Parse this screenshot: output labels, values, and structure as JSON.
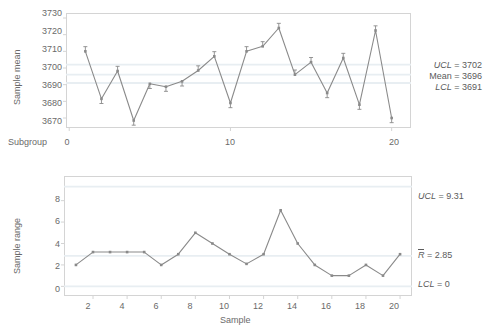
{
  "chart_data": [
    {
      "type": "line",
      "name": "xbar-chart",
      "title": "",
      "xlabel": "Subgroup",
      "ylabel": "Sample mean",
      "x": [
        1,
        2,
        3,
        4,
        5,
        6,
        7,
        8,
        9,
        10,
        11,
        12,
        13,
        14,
        15,
        16,
        17,
        18,
        19,
        20
      ],
      "values": [
        3710.0,
        3681.5,
        3698.2,
        3668.5,
        3690.5,
        3688.8,
        3692.0,
        3698.5,
        3707.0,
        3679.0,
        3710.0,
        3713.0,
        3724.0,
        3696.0,
        3703.5,
        3685.0,
        3706.0,
        3678.0,
        3722.5,
        3670.0
      ],
      "error_bars": [
        2.8,
        2.8,
        2.8,
        2.8,
        2.8,
        2.8,
        2.8,
        2.8,
        2.8,
        2.8,
        2.8,
        2.8,
        2.8,
        2.8,
        2.8,
        2.8,
        2.8,
        2.8,
        2.8,
        2.8
      ],
      "xticks": [
        0,
        10,
        20
      ],
      "yticks": [
        3670,
        3680,
        3690,
        3700,
        3710,
        3720,
        3730
      ],
      "xlim": [
        -0.2,
        21.2
      ],
      "ylim": [
        3664,
        3733
      ],
      "grid": true,
      "legend": "none",
      "control_limits": {
        "ucl": 3702,
        "center": 3696,
        "lcl": 3691,
        "ucl_label": "UCL = 3702",
        "center_label": "Mean = 3696",
        "lcl_label": "LCL = 3691"
      }
    },
    {
      "type": "line",
      "name": "range-chart",
      "title": "",
      "xlabel": "Sample",
      "ylabel": "Sample range",
      "x": [
        1,
        2,
        3,
        4,
        5,
        6,
        7,
        8,
        9,
        10,
        11,
        12,
        13,
        14,
        15,
        16,
        17,
        18,
        19,
        20
      ],
      "values": [
        2.0,
        3.2,
        3.2,
        3.2,
        3.2,
        2.0,
        3.0,
        5.0,
        4.0,
        3.0,
        2.1,
        3.0,
        7.1,
        4.0,
        2.0,
        1.0,
        1.0,
        2.0,
        1.0,
        3.0
      ],
      "xticks": [
        2,
        4,
        6,
        8,
        10,
        12,
        14,
        16,
        18,
        20
      ],
      "yticks": [
        0,
        2,
        4,
        6,
        8
      ],
      "xlim": [
        0.3,
        20.7
      ],
      "ylim": [
        -0.9,
        10.3
      ],
      "grid": true,
      "legend": "none",
      "control_limits": {
        "ucl": 9.31,
        "center": 2.85,
        "lcl": 0,
        "ucl_label": "UCL = 9.31",
        "center_label": "R = 2.85",
        "lcl_label": "LCL = 0"
      }
    }
  ],
  "xbar": {
    "ylabel": "Sample mean",
    "xlabel": "Subgroup",
    "ytick_labels": [
      "3730",
      "3720",
      "3710",
      "3700",
      "3690",
      "3680",
      "3670"
    ],
    "xtick_labels": [
      "0",
      "10",
      "20"
    ],
    "limits": {
      "ucl_prefix": "UCL",
      "ucl_value": " = 3702",
      "center_prefix": "Mean",
      "center_value": " = 3696",
      "lcl_prefix": "LCL",
      "lcl_value": " = 3691"
    }
  },
  "range": {
    "ylabel": "Sample range",
    "xlabel": "Sample",
    "ytick_labels": [
      "8",
      "6",
      "4",
      "2",
      "0"
    ],
    "xtick_labels": [
      "2",
      "4",
      "6",
      "8",
      "10",
      "12",
      "14",
      "16",
      "18",
      "20"
    ],
    "limits": {
      "ucl_prefix": "UCL",
      "ucl_value": " = 9.31",
      "center_prefix": "R",
      "center_value": " = 2.85",
      "lcl_prefix": "LCL",
      "lcl_value": " = 0"
    }
  },
  "colors": {
    "series": "#8a8a8a",
    "marker": "#8a8a8a",
    "grid": "#e8eef2",
    "frame": "#d4d4d4",
    "text": "#5b5b5b"
  }
}
